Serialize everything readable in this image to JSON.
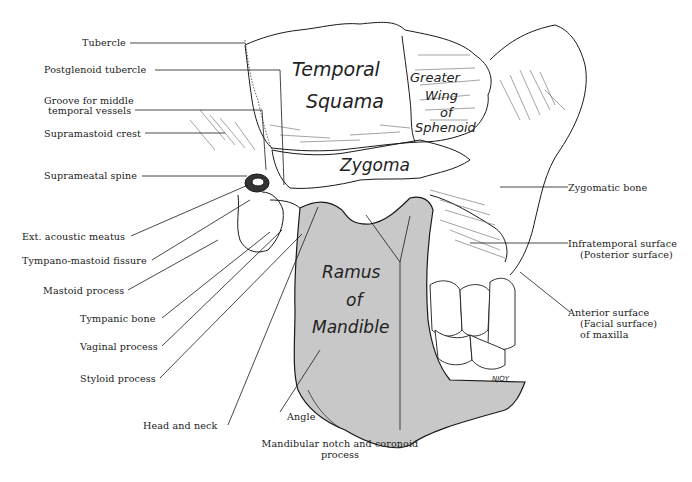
{
  "figure": {
    "signature": "NJOY",
    "colors": {
      "ink": "#1a1a1a",
      "mandible_fill": "#c8c8c8",
      "background": "#ffffff"
    }
  },
  "region_labels": {
    "temporal_squama": [
      "Temporal",
      "Squama"
    ],
    "greater_wing": [
      "Greater",
      "Wing",
      "of",
      "Sphenoid"
    ],
    "zygoma": "Zygoma",
    "ramus": [
      "Ramus",
      "of",
      "Mandible"
    ]
  },
  "left_labels": [
    {
      "id": "tubercle",
      "text": "Tubercle"
    },
    {
      "id": "postglenoid-tubercle",
      "text": "Postglenoid tubercle"
    },
    {
      "id": "groove-middle-temporal",
      "lines": [
        "Groove for middle",
        "temporal vessels"
      ]
    },
    {
      "id": "supramastoid-crest",
      "text": "Supramastoid crest"
    },
    {
      "id": "suprameatal-spine",
      "text": "Suprameatal spine"
    },
    {
      "id": "ext-acoustic-meatus",
      "text": "Ext. acoustic meatus"
    },
    {
      "id": "tympano-mastoid-fissure",
      "text": "Tympano-mastoid fissure"
    },
    {
      "id": "mastoid-process",
      "text": "Mastoid process"
    },
    {
      "id": "tympanic-bone",
      "text": "Tympanic bone"
    },
    {
      "id": "vaginal-process",
      "text": "Vaginal process"
    },
    {
      "id": "styloid-process",
      "text": "Styloid process"
    },
    {
      "id": "head-and-neck",
      "text": "Head and neck"
    }
  ],
  "bottom_labels": [
    {
      "id": "angle",
      "text": "Angle"
    },
    {
      "id": "mandibular-notch",
      "lines": [
        "Mandibular notch and coronoid",
        "process"
      ]
    }
  ],
  "right_labels": [
    {
      "id": "zygomatic-bone",
      "text": "Zygomatic bone"
    },
    {
      "id": "infratemporal-surface",
      "lines": [
        "Infratemporal surface",
        "(Posterior surface)"
      ]
    },
    {
      "id": "anterior-surface",
      "lines": [
        "Anterior surface",
        "(Facial surface)",
        "of maxilla"
      ]
    }
  ]
}
